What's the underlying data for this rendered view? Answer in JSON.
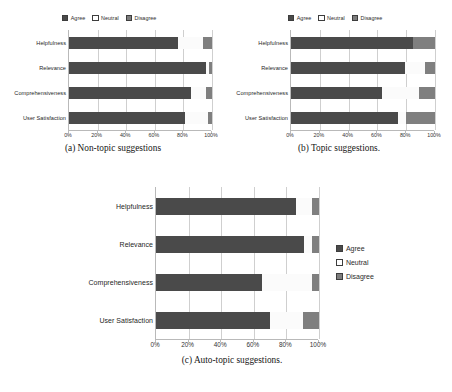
{
  "legend": {
    "agree": "Agree",
    "neutral": "Neutral",
    "disagree": "Disagree",
    "colors": {
      "agree": "#4a4a4a",
      "neutral": "#ffffff",
      "disagree": "#7f7f7f"
    }
  },
  "axis": {
    "ticks": [
      "0%",
      "20%",
      "40%",
      "60%",
      "80%",
      "100%"
    ],
    "min": 0,
    "max": 100
  },
  "categories": [
    "Helpfulness",
    "Relevance",
    "Comprehensiveness",
    "User Satisfaction"
  ],
  "captions": {
    "a": "(a) Non-topic suggestions",
    "b": "(b) Topic suggestions.",
    "c": "(c) Auto-topic suggestions."
  },
  "chart_data": [
    {
      "type": "bar",
      "title": "(a) Non-topic suggestions",
      "orientation": "horizontal",
      "stacked": true,
      "stacked_percent": true,
      "categories": [
        "Helpfulness",
        "Relevance",
        "Comprehensiveness",
        "User Satisfaction"
      ],
      "series": [
        {
          "name": "Agree",
          "values": [
            76,
            96,
            85,
            81
          ]
        },
        {
          "name": "Neutral",
          "values": [
            18,
            2,
            11,
            16
          ]
        },
        {
          "name": "Disagree",
          "values": [
            6,
            2,
            4,
            3
          ]
        }
      ],
      "xlabel": "",
      "ylabel": "",
      "xlim": [
        0,
        100
      ],
      "xticks": [
        "0%",
        "20%",
        "40%",
        "60%",
        "80%",
        "100%"
      ],
      "grid": true,
      "legend_position": "top"
    },
    {
      "type": "bar",
      "title": "(b) Topic suggestions.",
      "orientation": "horizontal",
      "stacked": true,
      "stacked_percent": true,
      "categories": [
        "Helpfulness",
        "Relevance",
        "Comprehensiveness",
        "User Satisfaction"
      ],
      "series": [
        {
          "name": "Agree",
          "values": [
            85,
            79,
            63,
            74
          ]
        },
        {
          "name": "Neutral",
          "values": [
            0,
            14,
            26,
            6
          ]
        },
        {
          "name": "Disagree",
          "values": [
            15,
            7,
            11,
            20
          ]
        }
      ],
      "xlabel": "",
      "ylabel": "",
      "xlim": [
        0,
        100
      ],
      "xticks": [
        "0%",
        "20%",
        "40%",
        "60%",
        "80%",
        "100%"
      ],
      "grid": true,
      "legend_position": "top"
    },
    {
      "type": "bar",
      "title": "(c) Auto-topic suggestions.",
      "orientation": "horizontal",
      "stacked": true,
      "stacked_percent": true,
      "categories": [
        "Helpfulness",
        "Relevance",
        "Comprehensiveness",
        "User Satisfaction"
      ],
      "series": [
        {
          "name": "Agree",
          "values": [
            86,
            91,
            65,
            70
          ]
        },
        {
          "name": "Neutral",
          "values": [
            10,
            5,
            31,
            20
          ]
        },
        {
          "name": "Disagree",
          "values": [
            4,
            4,
            4,
            10
          ]
        }
      ],
      "xlabel": "",
      "ylabel": "",
      "xlim": [
        0,
        100
      ],
      "xticks": [
        "0%",
        "20%",
        "40%",
        "60%",
        "80%",
        "100%"
      ],
      "grid": true,
      "legend_position": "right"
    }
  ]
}
